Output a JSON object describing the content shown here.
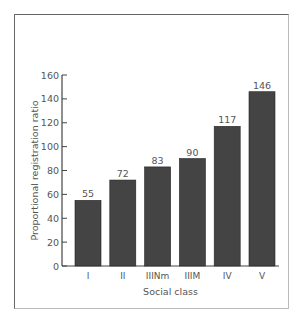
{
  "chart_data": {
    "type": "bar",
    "title": "",
    "xlabel": "Social class",
    "ylabel": "Proportional registration ratio",
    "categories": [
      "I",
      "II",
      "IIINm",
      "IIIM",
      "IV",
      "V"
    ],
    "values": [
      55,
      72,
      83,
      90,
      117,
      146
    ],
    "data_labels": [
      "55",
      "72",
      "83",
      "90",
      "117",
      "146"
    ],
    "ylim": [
      0,
      160
    ],
    "yticks": [
      0,
      20,
      40,
      60,
      80,
      100,
      120,
      140,
      160
    ],
    "grid": false,
    "legend": null,
    "bar_color": "#444444"
  }
}
